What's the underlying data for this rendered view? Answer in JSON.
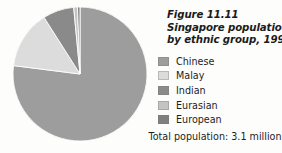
{
  "figure": {
    "caption_lines": [
      "Figure 11.11",
      "Singapore population",
      "by ethnic group, 1998"
    ],
    "total_population_text": "Total population: 3.1 million"
  },
  "legend": {
    "items": [
      {
        "label": "Chinese",
        "color": "#9d9d9d"
      },
      {
        "label": "Malay",
        "color": "#dcdcdc"
      },
      {
        "label": "Indian",
        "color": "#8a8a8a"
      },
      {
        "label": "Eurasian",
        "color": "#c4c4c4"
      },
      {
        "label": "European",
        "color": "#808080"
      }
    ]
  },
  "chart_data": {
    "type": "pie",
    "title": "Singapore population by ethnic group, 1998",
    "subtitle": "Figure 11.11",
    "annotation": "Total population: 3.1 million",
    "unit": "percent",
    "legend_position": "right",
    "grid": false,
    "start_angle_deg": 0,
    "direction": "clockwise",
    "categories": [
      "Chinese",
      "Malay",
      "Indian",
      "Eurasian",
      "European"
    ],
    "values": [
      77.0,
      14.0,
      7.5,
      0.9,
      0.6
    ],
    "colors": [
      "#9d9d9d",
      "#dcdcdc",
      "#8a8a8a",
      "#c4c4c4",
      "#808080"
    ],
    "series": [
      {
        "name": "Share of population 1998",
        "values": [
          77.0,
          14.0,
          7.5,
          0.9,
          0.6
        ]
      }
    ]
  },
  "style": {
    "background": "#fdfdfc",
    "text_color": "#1d1d1d",
    "slice_outline": "#ffffff",
    "pie": {
      "cx": 80,
      "cy": 74,
      "r": 67
    }
  }
}
